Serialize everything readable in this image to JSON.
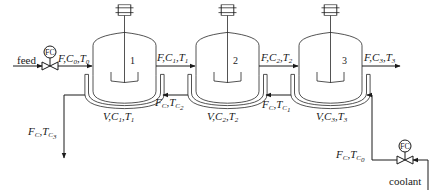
{
  "diagram": {
    "colors": {
      "line": "#1a1a1a",
      "background": "#ffffff"
    },
    "feed_label": "feed",
    "coolant_label": "coolant",
    "controllers": [
      {
        "id": "fc-feed",
        "label": "FC"
      },
      {
        "id": "fc-coolant",
        "label": "FC"
      }
    ],
    "reactors": [
      {
        "number": "1",
        "contents": {
          "v": "V,",
          "c": "C",
          "c_sub": "1",
          "sep": ",",
          "t": "T",
          "t_sub": "1"
        }
      },
      {
        "number": "2",
        "contents": {
          "v": "V,",
          "c": "C",
          "c_sub": "2",
          "sep": ",",
          "t": "T",
          "t_sub": "2"
        }
      },
      {
        "number": "3",
        "contents": {
          "v": "V,",
          "c": "C",
          "c_sub": "3",
          "sep": ",",
          "t": "T",
          "t_sub": "3"
        }
      }
    ],
    "process_streams": [
      {
        "id": "feed-stream",
        "f": "F,",
        "c": "C",
        "c_sub": "0",
        "sep": ",",
        "t": "T",
        "t_sub": "0"
      },
      {
        "id": "stream-1-2",
        "f": "F,",
        "c": "C",
        "c_sub": "1",
        "sep": ",",
        "t": "T",
        "t_sub": "1"
      },
      {
        "id": "stream-2-3",
        "f": "F,",
        "c": "C",
        "c_sub": "2",
        "sep": ",",
        "t": "T",
        "t_sub": "2"
      },
      {
        "id": "product-stream",
        "f": "F,",
        "c": "C",
        "c_sub": "3",
        "sep": ",",
        "t": "T",
        "t_sub": "3"
      }
    ],
    "coolant_streams": [
      {
        "id": "coolant-in",
        "f": "F",
        "f_sub": "C",
        "sep": ",",
        "t": "T",
        "t_sub": "C",
        "t_subsub": "0"
      },
      {
        "id": "coolant-3-2",
        "f": "F",
        "f_sub": "C",
        "sep": ",",
        "t": "T",
        "t_sub": "C",
        "t_subsub": "1"
      },
      {
        "id": "coolant-2-1",
        "f": "F",
        "f_sub": "C",
        "sep": ",",
        "t": "T",
        "t_sub": "C",
        "t_subsub": "2"
      },
      {
        "id": "coolant-out",
        "f": "F",
        "f_sub": "C",
        "sep": ",",
        "t": "T",
        "t_sub": "C",
        "t_subsub": "3"
      }
    ]
  }
}
